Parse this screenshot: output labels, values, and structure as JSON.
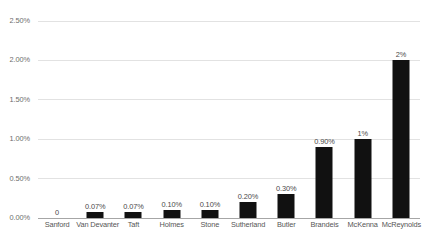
{
  "chart_data": {
    "type": "bar",
    "title": "",
    "xlabel": "",
    "ylabel": "",
    "ylim": [
      0,
      0.025
    ],
    "grid": true,
    "legend": "none",
    "orientation": "vertical",
    "bar_color": "#111111",
    "gridline_color": "#e2e2e2",
    "axis_color": "#a6a6a6",
    "background": "#ffffff",
    "categories": [
      "Sanford",
      "Van Devanter",
      "Taft",
      "Holmes",
      "Stone",
      "Sutherland",
      "Butler",
      "Brandeis",
      "McKenna",
      "McReynolds"
    ],
    "values": [
      0,
      0.0007,
      0.0007,
      0.001,
      0.001,
      0.002,
      0.003,
      0.009,
      0.01,
      0.02
    ],
    "data_labels": [
      "0",
      "0.07%",
      "0.07%",
      "0.10%",
      "0.10%",
      "0.20%",
      "0.30%",
      "0.90%",
      "1%",
      "2%"
    ],
    "y_ticks": [
      0.025,
      0.02,
      0.015,
      0.01,
      0.005,
      0
    ],
    "y_tick_labels": [
      "2.50%",
      "2.00%",
      "1.50%",
      "1.00%",
      "0.50%",
      "0.00%"
    ]
  }
}
